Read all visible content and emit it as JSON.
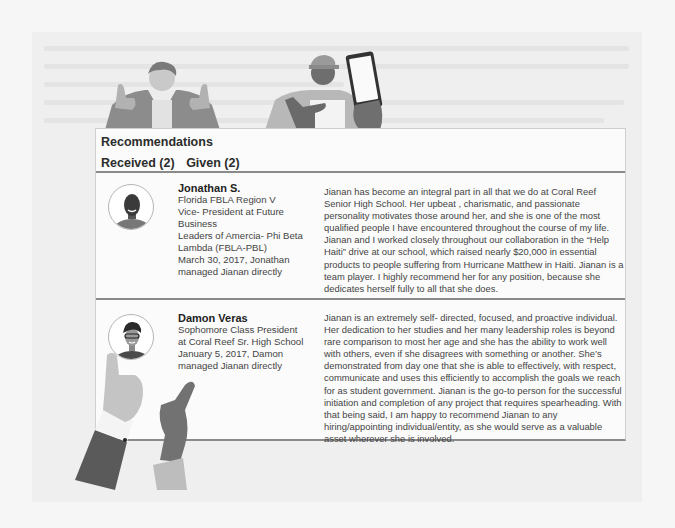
{
  "card": {
    "title": "Recommendations",
    "tabs": [
      {
        "label": "Received (2)",
        "active": true
      },
      {
        "label": "Given (2)",
        "active": false
      }
    ]
  },
  "recommendations": [
    {
      "name": "Jonathan S.",
      "details": [
        "Florida FBLA Region V",
        "Vice- President at Future Business",
        "Leaders of Amercia- Phi Beta",
        "Lambda (FBLA-PBL)",
        "March 30, 2017, Jonathan",
        "managed Jianan directly"
      ],
      "avatar_icon": "person-avatar-icon",
      "text": "Jianan has become an integral part in all that we do at Coral Reef Senior High School. Her upbeat , charismatic, and passionate personality motivates those around her, and she is one of the most qualified people I have encountered throughout the course of my life. Jianan and I worked closely throughout our collaboration in the “Help Haiti” drive at our school, which raised nearly $20,000 in essential products to people suffering from Hurricane Matthew in Haiti. Jianan is a team player. I highly recommend her for any position, because she dedicates herself fully to all that she does."
    },
    {
      "name": "Damon Veras",
      "details": [
        "Sophomore Class President",
        "at Coral Reef Sr. High School",
        "January 5, 2017, Damon",
        "managed Jianan directly"
      ],
      "avatar_icon": "person-avatar-icon",
      "text": "Jianan is an extremely self- directed, focused, and proactive individual. Her dedication to her studies and her many leadership roles is beyond rare comparison to most her age and she has the ability to work well with others, even if  she disagrees with something or another. She’s demonstrated from day one that she is able to effectively, with respect, communicate and uses this efficiently to accomplish the goals we reach for as student government. Jianan is the go-to person for the successful initiation and completion of any project that requires spearheading. With that being said, I am happy to recommend Jianan to any hiring/appointing individual/entity, as she would serve as a valuable asset wherever she is involved."
    }
  ],
  "colors": {
    "background": "#f6f6f6",
    "card": "#fbfbfb",
    "divider": "#8a8a8a",
    "text": "#444444"
  }
}
